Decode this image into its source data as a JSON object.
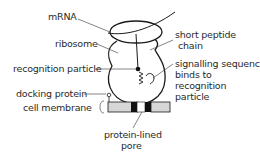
{
  "diagram": {
    "labels": {
      "mrna": "mRNA",
      "ribosome": "ribosome",
      "recognition_particle": "recognition particle",
      "docking_protein": "docking protein",
      "cell_membrane": "cell membrane",
      "short_peptide_line1": "short peptide",
      "short_peptide_line2": "chain",
      "signalling_line1": "signalling sequence",
      "signalling_line2": "binds to",
      "signalling_line3": "recognition",
      "signalling_line4": "particle",
      "pore_line1": "protein-lined",
      "pore_line2": "pore"
    },
    "colors": {
      "line": "#1a1a1a",
      "text": "#2a2a2a",
      "membrane_fill": "#d6d6d6",
      "protein_fill": "#111111"
    }
  }
}
